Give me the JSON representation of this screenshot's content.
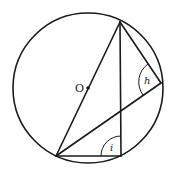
{
  "diagram": {
    "title": "",
    "circle": {
      "cx": 88,
      "cy": 88,
      "r": 75
    },
    "center": {
      "label": "O",
      "x": 88,
      "y": 88
    },
    "points": {
      "top": {
        "x": 120,
        "y": 22
      },
      "right": {
        "x": 161,
        "y": 83
      },
      "bottom_left": {
        "x": 56,
        "y": 156
      },
      "bottom_right": {
        "x": 122,
        "y": 156
      }
    },
    "angles": [
      {
        "label": "h",
        "vertex": "right"
      },
      {
        "label": "i",
        "vertex": "bottom_right"
      }
    ]
  }
}
